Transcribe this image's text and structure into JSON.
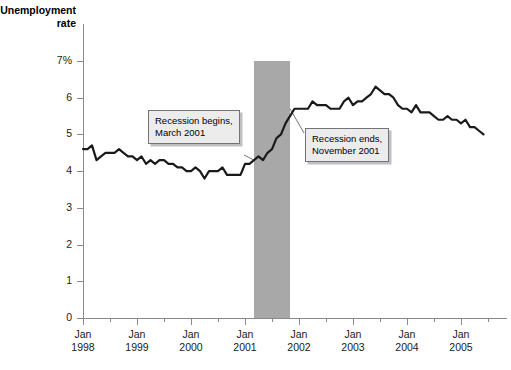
{
  "title": "Unemployment\nrate",
  "colors": {
    "line": "#1a1a1a",
    "recession_band": "#a8a8a8",
    "axis": "#8a8a8a",
    "callout_fill": "#ececed",
    "callout_border": "#73737a",
    "background": "#ffffff"
  },
  "y_axis": {
    "labels": [
      "7%",
      "6",
      "5",
      "4",
      "3",
      "2",
      "1",
      "0"
    ],
    "values": [
      7,
      6,
      5,
      4,
      3,
      2,
      1,
      0
    ]
  },
  "x_axis": {
    "labels": [
      "Jan\n1998",
      "Jan\n1999",
      "Jan\n2000",
      "Jan\n2001",
      "Jan\n2002",
      "Jan\n2003",
      "Jan\n2004",
      "Jan\n2005"
    ],
    "years": [
      1998,
      1999,
      2000,
      2001,
      2002,
      2003,
      2004,
      2005
    ]
  },
  "annotations": [
    {
      "id": "recession-begins",
      "text": "Recession begins,\nMarch 2001"
    },
    {
      "id": "recession-ends",
      "text": "Recession ends,\nNovember 2001"
    }
  ],
  "chart_data": {
    "type": "line",
    "title": "Unemployment rate",
    "xlabel": "",
    "ylabel": "Unemployment rate",
    "ylim": [
      0,
      7
    ],
    "xlim": [
      "1998-01",
      "2005-07"
    ],
    "grid": false,
    "legend": null,
    "y_tick_labels": [
      "0",
      "1",
      "2",
      "3",
      "4",
      "5",
      "6",
      "7%"
    ],
    "x_tick_labels": [
      "Jan 1998",
      "Jan 1999",
      "Jan 2000",
      "Jan 2001",
      "Jan 2002",
      "Jan 2003",
      "Jan 2004",
      "Jan 2005"
    ],
    "units": "percent",
    "frequency": "monthly",
    "shaded_regions": [
      {
        "label": "Recession",
        "start": "2001-03",
        "end": "2001-11",
        "color": "#a8a8a8"
      }
    ],
    "annotations": [
      {
        "text": "Recession begins, March 2001",
        "points_to_x": "2001-03",
        "points_to_y": 4.3
      },
      {
        "text": "Recession ends, November 2001",
        "points_to_x": "2001-11",
        "points_to_y": 5.7
      }
    ],
    "x": [
      "1998-01",
      "1998-02",
      "1998-03",
      "1998-04",
      "1998-05",
      "1998-06",
      "1998-07",
      "1998-08",
      "1998-09",
      "1998-10",
      "1998-11",
      "1998-12",
      "1999-01",
      "1999-02",
      "1999-03",
      "1999-04",
      "1999-05",
      "1999-06",
      "1999-07",
      "1999-08",
      "1999-09",
      "1999-10",
      "1999-11",
      "1999-12",
      "2000-01",
      "2000-02",
      "2000-03",
      "2000-04",
      "2000-05",
      "2000-06",
      "2000-07",
      "2000-08",
      "2000-09",
      "2000-10",
      "2000-11",
      "2000-12",
      "2001-01",
      "2001-02",
      "2001-03",
      "2001-04",
      "2001-05",
      "2001-06",
      "2001-07",
      "2001-08",
      "2001-09",
      "2001-10",
      "2001-11",
      "2001-12",
      "2002-01",
      "2002-02",
      "2002-03",
      "2002-04",
      "2002-05",
      "2002-06",
      "2002-07",
      "2002-08",
      "2002-09",
      "2002-10",
      "2002-11",
      "2002-12",
      "2003-01",
      "2003-02",
      "2003-03",
      "2003-04",
      "2003-05",
      "2003-06",
      "2003-07",
      "2003-08",
      "2003-09",
      "2003-10",
      "2003-11",
      "2003-12",
      "2004-01",
      "2004-02",
      "2004-03",
      "2004-04",
      "2004-05",
      "2004-06",
      "2004-07",
      "2004-08",
      "2004-09",
      "2004-10",
      "2004-11",
      "2004-12",
      "2005-01",
      "2005-02",
      "2005-03",
      "2005-04",
      "2005-05",
      "2005-06"
    ],
    "values": [
      4.6,
      4.6,
      4.7,
      4.3,
      4.4,
      4.5,
      4.5,
      4.5,
      4.6,
      4.5,
      4.4,
      4.4,
      4.3,
      4.4,
      4.2,
      4.3,
      4.2,
      4.3,
      4.3,
      4.2,
      4.2,
      4.1,
      4.1,
      4.0,
      4.0,
      4.1,
      4.0,
      3.8,
      4.0,
      4.0,
      4.0,
      4.1,
      3.9,
      3.9,
      3.9,
      3.9,
      4.2,
      4.2,
      4.3,
      4.4,
      4.3,
      4.5,
      4.6,
      4.9,
      5.0,
      5.3,
      5.5,
      5.7,
      5.7,
      5.7,
      5.7,
      5.9,
      5.8,
      5.8,
      5.8,
      5.7,
      5.7,
      5.7,
      5.9,
      6.0,
      5.8,
      5.9,
      5.9,
      6.0,
      6.1,
      6.3,
      6.2,
      6.1,
      6.1,
      6.0,
      5.8,
      5.7,
      5.7,
      5.6,
      5.8,
      5.6,
      5.6,
      5.6,
      5.5,
      5.4,
      5.4,
      5.5,
      5.4,
      5.4,
      5.3,
      5.4,
      5.2,
      5.2,
      5.1,
      5.0
    ]
  }
}
